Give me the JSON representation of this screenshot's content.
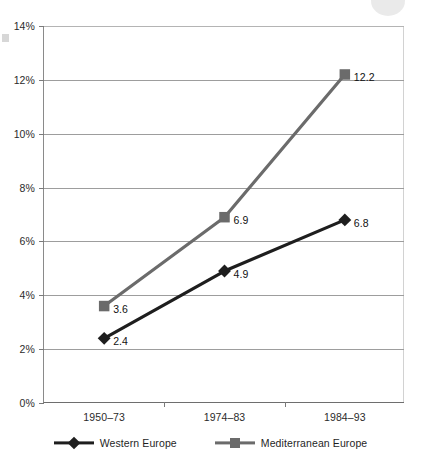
{
  "chart_data": {
    "type": "line",
    "title": "",
    "xlabel": "",
    "ylabel": "",
    "categories": [
      "1950–73",
      "1974–83",
      "1984–93"
    ],
    "series": [
      {
        "name": "Western Europe",
        "marker": "diamond",
        "color": "#1e1e1e",
        "values": [
          2.4,
          4.9,
          6.8
        ],
        "labels": [
          "2.4",
          "4.9",
          "6.8"
        ]
      },
      {
        "name": "Mediterranean Europe",
        "marker": "square",
        "color": "#6b6b6b",
        "values": [
          3.6,
          6.9,
          12.2
        ],
        "labels": [
          "3.6",
          "6.9",
          "12.2"
        ]
      }
    ],
    "ylim": [
      0,
      14
    ],
    "ytick_values": [
      0,
      2,
      4,
      6,
      8,
      10,
      12,
      14
    ],
    "ytick_labels": [
      "0%",
      "2%",
      "4%",
      "6%",
      "8%",
      "10%",
      "12%",
      "14%"
    ],
    "grid": true,
    "grid_axis": "y",
    "legend_position": "bottom",
    "units": "percent"
  },
  "legend": {
    "items": [
      {
        "label": "Western Europe",
        "icon": "diamond-marker-icon",
        "color": "#1e1e1e"
      },
      {
        "label": "Mediterranean Europe",
        "icon": "square-marker-icon",
        "color": "#6b6b6b"
      }
    ]
  }
}
